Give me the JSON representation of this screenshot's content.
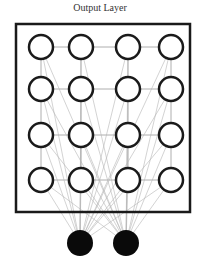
{
  "diagram": {
    "title": "Output Layer",
    "colors": {
      "box": "#1a1a1a",
      "node_stroke": "#1a1a1a",
      "node_fill": "#ffffff",
      "input_node_fill": "#0a0a0a",
      "grid_edge": "#9a9a9a",
      "connection": "#b5b5b5"
    },
    "box": {
      "x": 16,
      "y": 24,
      "width": 174,
      "height": 188
    },
    "output_grid": {
      "rows": 4,
      "cols": 4,
      "col_x": [
        41,
        81,
        128,
        171
      ],
      "row_y": [
        47,
        89,
        135,
        180
      ],
      "radius": 12
    },
    "input_nodes": [
      {
        "id": "input-1",
        "cx": 80,
        "cy": 243,
        "r": 13
      },
      {
        "id": "input-2",
        "cx": 126,
        "cy": 243,
        "r": 13
      }
    ]
  }
}
